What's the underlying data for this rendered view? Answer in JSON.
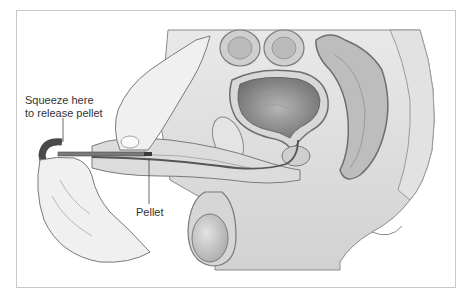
{
  "figure": {
    "type": "anatomical-illustration",
    "labels": {
      "squeeze_line1": "Squeeze here",
      "squeeze_line2": "to release pellet",
      "pellet": "Pellet"
    },
    "colors": {
      "frame_border": "#c8c8c8",
      "tissue_light": "#e6e6e6",
      "tissue_mid": "#bdbdbd",
      "tissue_dark": "#7a7a7a",
      "applicator_dark": "#4a4a4a",
      "text": "#333333"
    }
  }
}
